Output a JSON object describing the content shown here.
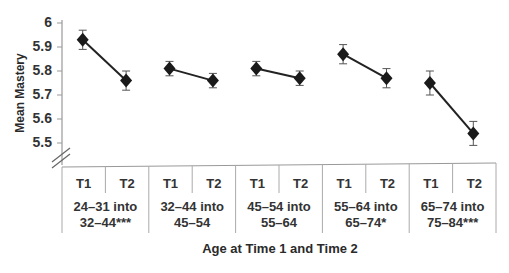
{
  "chart_data": {
    "type": "line",
    "title": "",
    "xlabel": "Age at Time 1 and Time 2",
    "ylabel": "Mean Mastery",
    "ylim": [
      5.4,
      6.0
    ],
    "yticks": [
      "6",
      "5.9",
      "5.8",
      "5.7",
      "5.6",
      "5.5"
    ],
    "axis_break": true,
    "grid": false,
    "legend": null,
    "groups": [
      {
        "label_line1": "24–31 into",
        "label_line2": "32–44***",
        "t1": 5.93,
        "t2": 5.76,
        "t1_err": 0.04,
        "t2_err": 0.04
      },
      {
        "label_line1": "32–44 into",
        "label_line2": "45–54",
        "t1": 5.81,
        "t2": 5.76,
        "t1_err": 0.03,
        "t2_err": 0.03
      },
      {
        "label_line1": "45–54 into",
        "label_line2": "55–64",
        "t1": 5.81,
        "t2": 5.77,
        "t1_err": 0.03,
        "t2_err": 0.03
      },
      {
        "label_line1": "55–64 into",
        "label_line2": "65–74*",
        "t1": 5.87,
        "t2": 5.77,
        "t1_err": 0.04,
        "t2_err": 0.04
      },
      {
        "label_line1": "65–74 into",
        "label_line2": "75–84***",
        "t1": 5.75,
        "t2": 5.54,
        "t1_err": 0.05,
        "t2_err": 0.05
      }
    ],
    "time_labels": [
      "T1",
      "T2"
    ]
  }
}
